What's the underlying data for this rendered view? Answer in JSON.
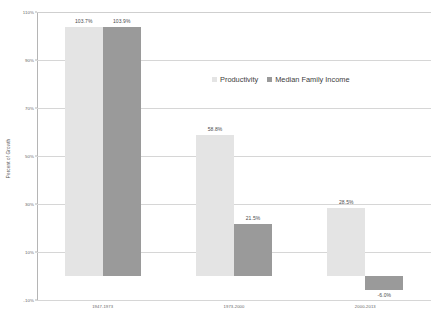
{
  "chart_data": {
    "type": "bar",
    "title": "",
    "subtitle": "",
    "xlabel": "",
    "ylabel": "Percent of Growth",
    "categories": [
      "1947-1973",
      "1973-2000",
      "2000-2013"
    ],
    "series": [
      {
        "name": "Productivity",
        "color": "#e4e4e4",
        "values": [
          103.7,
          58.8,
          28.5
        ],
        "labels": [
          "103.7%",
          "58.8%",
          "28.5%"
        ]
      },
      {
        "name": "Median Family Income",
        "color": "#9a9a9a",
        "values": [
          103.9,
          21.5,
          -6.0
        ],
        "labels": [
          "103.9%",
          "21.5%",
          "-6.0%"
        ]
      }
    ],
    "ylim": [
      -10,
      110
    ],
    "ytick_values": [
      -10,
      10,
      30,
      50,
      70,
      90,
      110
    ],
    "ytick_labels": [
      "-10%",
      "10%",
      "30%",
      "50%",
      "70%",
      "90%",
      "110%"
    ],
    "grid": true,
    "legend_position": "center-top-inside"
  },
  "legend": {
    "entries": [
      {
        "label": "Productivity",
        "swatch_name": "legend-swatch-productivity"
      },
      {
        "label": "Median Family Income",
        "swatch_name": "legend-swatch-median-family-income"
      }
    ]
  },
  "axes": {
    "y_title": "Percent of Growth"
  }
}
